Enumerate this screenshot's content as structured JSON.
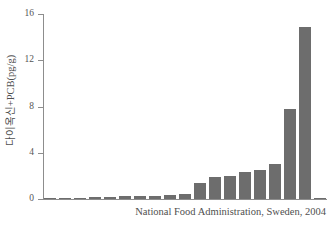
{
  "chart_data": {
    "type": "bar",
    "title": "",
    "subtitle": "",
    "xlabel": "",
    "ylabel": "다이옥신+PCB(pg/g)",
    "ylim": [
      0,
      16
    ],
    "yticks": [
      0,
      4,
      8,
      12,
      16
    ],
    "ytick_labels": [
      "0",
      "4",
      "8",
      "12",
      "16"
    ],
    "grid": false,
    "legend": null,
    "xtick_labels": [],
    "bar_color": "#6d6d6d",
    "axis_color": "#8d8d8d",
    "categories": [
      "1",
      "2",
      "3",
      "4",
      "5",
      "6",
      "7",
      "8",
      "9",
      "10",
      "11",
      "12",
      "13",
      "14",
      "15",
      "16",
      "17",
      "18",
      "19"
    ],
    "values": [
      0.08,
      0.08,
      0.12,
      0.14,
      0.18,
      0.25,
      0.3,
      0.3,
      0.32,
      0.45,
      1.4,
      1.9,
      2.0,
      2.3,
      2.5,
      3.0,
      7.8,
      14.9,
      0.08
    ],
    "series": [
      {
        "name": "다이옥신+PCB",
        "values": [
          0.08,
          0.08,
          0.12,
          0.14,
          0.18,
          0.25,
          0.3,
          0.3,
          0.32,
          0.45,
          1.4,
          1.9,
          2.0,
          2.3,
          2.5,
          3.0,
          7.8,
          14.9,
          0.08
        ]
      }
    ],
    "annotations": [
      "National Food Administration, Sweden, 2004"
    ]
  },
  "axis": {
    "y_label": "다이옥신+PCB(pg/g)",
    "ticks": [
      {
        "value": 16,
        "label": "16"
      },
      {
        "value": 12,
        "label": "12"
      },
      {
        "value": 8,
        "label": "8"
      },
      {
        "value": 4,
        "label": "4"
      },
      {
        "value": 0,
        "label": "0"
      }
    ]
  },
  "caption": {
    "source": "National Food Administration, Sweden, 2004"
  },
  "colors": {
    "bar": "#6d6d6d",
    "axis": "#8d8d8d",
    "text": "#4f4f4f",
    "background": "#ffffff"
  }
}
